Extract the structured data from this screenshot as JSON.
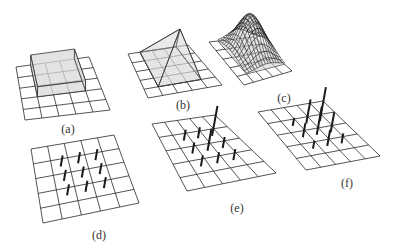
{
  "figure": {
    "panels": [
      {
        "id": "a",
        "label": "(a)",
        "label_pos": [
          68,
          122
        ],
        "type": "box",
        "grid": {
          "tl": [
            16,
            67
          ],
          "tr": [
            89,
            57
          ],
          "br": [
            110,
            110
          ],
          "bl": [
            25,
            120
          ],
          "n": 5
        },
        "shape": {
          "u0": 1,
          "u1": 4,
          "v0": 0,
          "v1": 3,
          "height": 10
        }
      },
      {
        "id": "b",
        "label": "(b)",
        "label_pos": [
          183,
          98
        ],
        "type": "pyramid",
        "grid": {
          "tl": [
            128,
            54
          ],
          "tr": [
            188,
            45
          ],
          "br": [
            222,
            85
          ],
          "bl": [
            148,
            98
          ],
          "n": 5
        },
        "shape": {
          "u0": 1,
          "u1": 4,
          "v0": 0,
          "v1": 4,
          "apex_uv": [
            2.5,
            1.5
          ],
          "apex_xy": [
            180,
            29
          ]
        }
      },
      {
        "id": "c",
        "label": "(c)",
        "label_pos": [
          284,
          91
        ],
        "type": "gaussian",
        "grid": {
          "tl": [
            209,
            42
          ],
          "tr": [
            254,
            37
          ],
          "br": [
            292,
            71
          ],
          "bl": [
            244,
            85
          ],
          "n": 5
        },
        "shape": {
          "center_uv": [
            3.2,
            1.8
          ],
          "sigma": 1.1,
          "height": 38,
          "mesh_n": 14
        }
      },
      {
        "id": "d",
        "label": "(d)",
        "label_pos": [
          99,
          228
        ],
        "type": "spikes",
        "grid": {
          "tl": [
            31,
            149
          ],
          "tr": [
            114,
            135
          ],
          "br": [
            139,
            203
          ],
          "bl": [
            43,
            223
          ],
          "n": 5
        },
        "spikes": [
          {
            "uv": [
              1.5,
              1.5
            ],
            "h": 11
          },
          {
            "uv": [
              2.5,
              1.5
            ],
            "h": 11
          },
          {
            "uv": [
              3.5,
              1.5
            ],
            "h": 11
          },
          {
            "uv": [
              1.5,
              2.5
            ],
            "h": 11
          },
          {
            "uv": [
              2.5,
              2.5
            ],
            "h": 11
          },
          {
            "uv": [
              3.5,
              2.5
            ],
            "h": 11
          },
          {
            "uv": [
              1.5,
              3.5
            ],
            "h": 11
          },
          {
            "uv": [
              2.5,
              3.5
            ],
            "h": 11
          },
          {
            "uv": [
              3.5,
              3.5
            ],
            "h": 11
          }
        ]
      },
      {
        "id": "e",
        "label": "(e)",
        "label_pos": [
          237,
          201
        ],
        "type": "spikes",
        "grid": {
          "tl": [
            152,
            124
          ],
          "tr": [
            215,
            115
          ],
          "br": [
            276,
            173
          ],
          "bl": [
            187,
            191
          ],
          "n": 5
        },
        "spikes": [
          {
            "uv": [
              1.5,
              1.5
            ],
            "h": 11
          },
          {
            "uv": [
              2.5,
              1.5
            ],
            "h": 11
          },
          {
            "uv": [
              3.5,
              1.5
            ],
            "h": 30
          },
          {
            "uv": [
              1.5,
              2.5
            ],
            "h": 11
          },
          {
            "uv": [
              2.5,
              2.5
            ],
            "h": 22
          },
          {
            "uv": [
              3.5,
              2.5
            ],
            "h": 11
          },
          {
            "uv": [
              1.5,
              3.5
            ],
            "h": 11
          },
          {
            "uv": [
              2.5,
              3.5
            ],
            "h": 11
          },
          {
            "uv": [
              3.5,
              3.5
            ],
            "h": 11
          }
        ]
      },
      {
        "id": "f",
        "label": "(f)",
        "label_pos": [
          347,
          176
        ],
        "type": "spikes",
        "grid": {
          "tl": [
            258,
            112
          ],
          "tr": [
            323,
            101
          ],
          "br": [
            380,
            156
          ],
          "bl": [
            306,
            170
          ],
          "n": 5
        },
        "spikes": [
          {
            "uv": [
              1.5,
              1.5
            ],
            "h": 8
          },
          {
            "uv": [
              2.5,
              1.5
            ],
            "h": 24
          },
          {
            "uv": [
              3.5,
              1.5
            ],
            "h": 34
          },
          {
            "uv": [
              1.5,
              2.5
            ],
            "h": 14
          },
          {
            "uv": [
              2.5,
              2.5
            ],
            "h": 28
          },
          {
            "uv": [
              3.5,
              2.5
            ],
            "h": 20
          },
          {
            "uv": [
              1.5,
              3.5
            ],
            "h": 8
          },
          {
            "uv": [
              2.5,
              3.5
            ],
            "h": 16
          },
          {
            "uv": [
              3.5,
              3.5
            ],
            "h": 10
          }
        ]
      }
    ]
  }
}
